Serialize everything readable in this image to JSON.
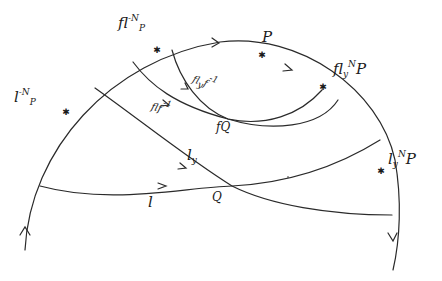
{
  "diagram": {
    "type": "hand-drawn geometric diagram",
    "stroke_color": "#2a2a2a",
    "background": "#ffffff",
    "labels": {
      "fl_minus_N_P": {
        "base": "fl",
        "sup": "-N",
        "tail": "P"
      },
      "P": "P",
      "fly_N_P": {
        "base": "fl",
        "sub": "y",
        "sup": "N",
        "tail": "P"
      },
      "l_minus_N_P": {
        "base": "l",
        "sup": "-N",
        "tail": "P"
      },
      "ly_N_P": {
        "base": "l",
        "sub": "y",
        "sup": "N",
        "tail": "P"
      },
      "flyf_inv": {
        "base": "fl",
        "sub": "y",
        "tail": "f",
        "sup": "-1"
      },
      "flf_inv": {
        "base": "flf",
        "sup": "-1"
      },
      "fQ": "fQ",
      "ly": {
        "base": "l",
        "sub": "y"
      },
      "l": "l",
      "Q": "Q"
    },
    "points": [
      {
        "name": "fl^-N P",
        "x": 157,
        "y": 50
      },
      {
        "name": "P",
        "x": 262,
        "y": 55
      },
      {
        "name": "fl_y^N P",
        "x": 323,
        "y": 87
      },
      {
        "name": "l^-N P",
        "x": 66,
        "y": 112
      },
      {
        "name": "l_y^N P",
        "x": 381,
        "y": 171
      },
      {
        "name": "fQ",
        "x": 228,
        "y": 119
      },
      {
        "name": "Q",
        "x": 232,
        "y": 186
      }
    ]
  }
}
